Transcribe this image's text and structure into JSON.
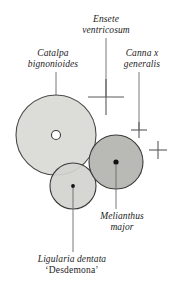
{
  "diagram": {
    "background_color": "#ffffff",
    "ink_color": "#1c1c1c",
    "labels": {
      "ensete": "Ensete ventricosum",
      "ensete_line1": "Ensete",
      "ensete_line2": "ventricosum",
      "catalpa": "Catalpa bignonioides",
      "catalpa_line1": "Catalpa",
      "catalpa_line2": "bignonioides",
      "canna": "Canna x generalis",
      "canna_line1": "Canna x",
      "canna_line2": "generalis",
      "melianthus": "Melianthus major",
      "melianthus_line1": "Melianthus",
      "melianthus_line2": "major",
      "ligularia": "Ligularia dentata 'Desdemona'",
      "ligularia_line1": "Ligularia dentata",
      "ligularia_line2": "‘Desdemona’"
    },
    "plants": [
      {
        "id": "catalpa",
        "name": "Catalpa bignonioides",
        "symbol": "filled-circle-with-open-center",
        "cx": 56,
        "cy": 135,
        "r": 40,
        "fill": "#dcdcd8",
        "stroke": "#4a4a4a",
        "center_marker": "open-circle",
        "center_marker_r": 4.5,
        "leader_from_x": 56,
        "leader_from_y": 72,
        "leader_to_x": 56,
        "leader_to_y": 130
      },
      {
        "id": "melianthus",
        "name": "Melianthus major",
        "symbol": "filled-circle-with-dot",
        "cx": 116,
        "cy": 162,
        "r": 27,
        "fill": "#b5b5b2",
        "stroke": "#3a3a3a",
        "center_marker": "filled-dot",
        "center_marker_r": 2.6,
        "leader_from_x": 116,
        "leader_from_y": 164,
        "leader_to_x": 116,
        "leader_to_y": 209
      },
      {
        "id": "ligularia",
        "name": "Ligularia dentata 'Desdemona'",
        "symbol": "filled-circle-with-dot",
        "cx": 73,
        "cy": 186,
        "r": 23,
        "fill": "#d2d2cf",
        "stroke": "#3a3a3a",
        "center_marker": "filled-dot",
        "center_marker_r": 1.9,
        "leader_from_x": 73,
        "leader_from_y": 188,
        "leader_to_x": 73,
        "leader_to_y": 252
      },
      {
        "id": "ensete",
        "name": "Ensete ventricosum",
        "symbol": "large-cross",
        "cx": 106,
        "cy": 97,
        "arm": 18,
        "stroke": "#5a5a5a",
        "leader_from_x": 106,
        "leader_from_y": 38,
        "leader_to_x": 106,
        "leader_to_y": 97
      },
      {
        "id": "canna-1",
        "name": "Canna x generalis",
        "symbol": "small-cross",
        "cx": 139,
        "cy": 130,
        "arm": 8,
        "stroke": "#5a5a5a",
        "leader_from_x": 139,
        "leader_from_y": 72,
        "leader_to_x": 139,
        "leader_to_y": 130
      },
      {
        "id": "canna-2",
        "name": "Canna x generalis",
        "symbol": "small-cross",
        "cx": 158,
        "cy": 150,
        "arm": 9,
        "stroke": "#5a5a5a"
      }
    ]
  }
}
